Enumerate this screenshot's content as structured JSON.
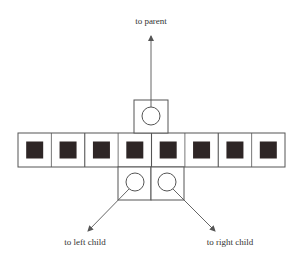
{
  "diagram": {
    "type": "btree-node-layout",
    "colors": {
      "stroke": "#555555",
      "key_fill": "#2e2626",
      "background": "#ffffff",
      "text": "#333333"
    },
    "labels": {
      "parent": "to parent",
      "left_child": "to left child",
      "right_child": "to right child"
    },
    "keys_row": {
      "count": 8,
      "x": 18,
      "y": 133,
      "width": 267,
      "height": 34,
      "group_size": 2
    },
    "parent_pointer": {
      "box": {
        "x": 134,
        "y": 100,
        "w": 34,
        "h": 33
      },
      "circle": {
        "cx": 151,
        "cy": 116,
        "r": 9
      },
      "arrow": {
        "x1": 151,
        "y1": 116,
        "x2": 151,
        "y2": 36
      }
    },
    "child_pointers": [
      {
        "name": "left",
        "box": {
          "x": 118,
          "y": 167,
          "w": 33,
          "h": 33
        },
        "circle": {
          "cx": 135,
          "cy": 182,
          "r": 9
        },
        "arrow": {
          "x1": 129,
          "y1": 189,
          "x2": 88,
          "y2": 231
        }
      },
      {
        "name": "right",
        "box": {
          "x": 151,
          "y": 167,
          "w": 33,
          "h": 33
        },
        "circle": {
          "cx": 167,
          "cy": 182,
          "r": 9
        },
        "arrow": {
          "x1": 173,
          "y1": 189,
          "x2": 215,
          "y2": 231
        }
      }
    ]
  }
}
